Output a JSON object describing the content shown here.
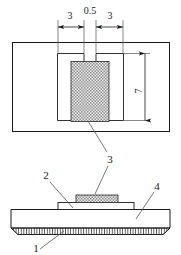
{
  "figure": {
    "title": "",
    "views": {
      "top_view": {
        "name": "top-view",
        "dimensions": [
          {
            "label": "3",
            "id": "dim-left-3"
          },
          {
            "label": "0.5",
            "id": "dim-center-05"
          },
          {
            "label": "3",
            "id": "dim-right-3"
          },
          {
            "label": "7",
            "id": "dim-vertical-7",
            "orientation": "vertical"
          }
        ],
        "callouts": [
          {
            "label": "3",
            "id": "callout-3"
          }
        ]
      },
      "section_view": {
        "name": "section-view",
        "callouts": [
          {
            "label": "2",
            "id": "callout-2"
          },
          {
            "label": "4",
            "id": "callout-4"
          },
          {
            "label": "1",
            "id": "callout-1"
          }
        ]
      }
    },
    "colors": {
      "line": "#1a1a1a",
      "thin_line": "#555555",
      "hatch_fill": "#d9d9d9",
      "background": "#ffffff"
    }
  }
}
